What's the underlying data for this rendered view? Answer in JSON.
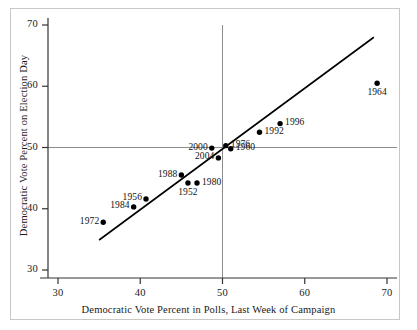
{
  "chart_data": {
    "type": "scatter",
    "title": "",
    "xlabel": "Democratic Vote Percent in Polls, Last Week of Campaign",
    "ylabel": "Democratic Vote Percent on Election Day",
    "xlim": [
      27,
      72
    ],
    "ylim": [
      28,
      72
    ],
    "xticks": [
      30,
      40,
      50,
      60,
      70
    ],
    "yticks": [
      30,
      40,
      50,
      60,
      70
    ],
    "grid": false,
    "legend": "none",
    "reference_lines": [
      {
        "name": "vertical-50-line",
        "type": "vertical",
        "value": 50,
        "color": "#8c8c8c"
      },
      {
        "name": "horizontal-50-line",
        "type": "horizontal",
        "value": 50,
        "color": "#8c8c8c"
      },
      {
        "name": "regression-line",
        "type": "segment",
        "x1": 35.0,
        "y1": 34.9,
        "x2": 68.4,
        "y2": 68.0,
        "color": "#000000"
      }
    ],
    "points": [
      {
        "label": "1972",
        "x": 35.5,
        "y": 37.8,
        "label_pos": "left"
      },
      {
        "label": "1984",
        "x": 39.2,
        "y": 40.3,
        "label_pos": "left"
      },
      {
        "label": "1956",
        "x": 40.7,
        "y": 41.6,
        "label_pos": "left"
      },
      {
        "label": "1988",
        "x": 45.0,
        "y": 45.5,
        "label_pos": "left"
      },
      {
        "label": "1952",
        "x": 45.8,
        "y": 44.2,
        "label_pos": "below"
      },
      {
        "label": "1980",
        "x": 46.9,
        "y": 44.2,
        "label_pos": "right"
      },
      {
        "label": "2000",
        "x": 48.7,
        "y": 49.9,
        "label_pos": "left"
      },
      {
        "label": "2004",
        "x": 49.5,
        "y": 48.3,
        "label_pos": "left"
      },
      {
        "label": "1976",
        "x": 50.4,
        "y": 50.3,
        "label_pos": "right"
      },
      {
        "label": "1960",
        "x": 51.0,
        "y": 49.8,
        "label_pos": "right"
      },
      {
        "label": "1992",
        "x": 54.5,
        "y": 52.5,
        "label_pos": "right"
      },
      {
        "label": "1996",
        "x": 57.0,
        "y": 53.9,
        "label_pos": "right"
      },
      {
        "label": "1964",
        "x": 68.8,
        "y": 60.5,
        "label_pos": "below"
      }
    ]
  },
  "axis": {
    "x_tick_labels": [
      "30",
      "40",
      "50",
      "60",
      "70"
    ],
    "y_tick_labels": [
      "30",
      "40",
      "50",
      "60",
      "70"
    ],
    "x_title": "Democratic Vote Percent in Polls, Last Week of Campaign",
    "y_title": "Democratic Vote Percent on Election Day"
  }
}
